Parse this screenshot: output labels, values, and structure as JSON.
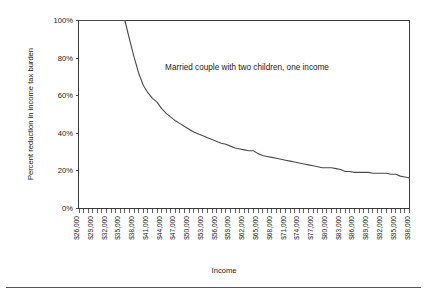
{
  "chart_data": {
    "type": "line",
    "title": "",
    "annotation": "Married couple with two children, one income",
    "xlabel": "Income",
    "ylabel": "Percent reduction in income tax burden",
    "xlim": [
      26000,
      98000
    ],
    "ylim": [
      0,
      100
    ],
    "grid": false,
    "legend_position": "none",
    "line_color": "#4a4a4a",
    "frame_color": "#3a3a3a",
    "background_color": "#ffffff",
    "ytick_labels": [
      "0%",
      "20%",
      "40%",
      "60%",
      "80%",
      "100%"
    ],
    "ytick_values": [
      0,
      20,
      40,
      60,
      80,
      100
    ],
    "xtick_labels": [
      "$26,000",
      "$29,000",
      "$32,000",
      "$35,000",
      "$38,000",
      "$41,000",
      "$44,000",
      "$47,000",
      "$50,000",
      "$53,000",
      "$56,000",
      "$59,000",
      "$62,000",
      "$65,000",
      "$68,000",
      "$71,000",
      "$74,000",
      "$77,000",
      "$80,000",
      "$83,000",
      "$86,000",
      "$89,000",
      "$92,000",
      "$95,000",
      "$98,000"
    ],
    "xtick_values": [
      26000,
      29000,
      32000,
      35000,
      38000,
      41000,
      44000,
      47000,
      50000,
      53000,
      56000,
      59000,
      62000,
      65000,
      68000,
      71000,
      74000,
      77000,
      80000,
      83000,
      86000,
      89000,
      92000,
      95000,
      98000
    ],
    "minor_tick_step": 1000,
    "x": [
      26000,
      27000,
      28000,
      29000,
      30000,
      31000,
      32000,
      33000,
      34000,
      35000,
      36000,
      37000,
      38000,
      39000,
      40000,
      41000,
      42000,
      43000,
      44000,
      45000,
      46000,
      47000,
      48000,
      49000,
      50000,
      51000,
      52000,
      53000,
      54000,
      55000,
      56000,
      57000,
      58000,
      59000,
      60000,
      61000,
      62000,
      63000,
      64000,
      65000,
      66000,
      67000,
      68000,
      69000,
      70000,
      71000,
      72000,
      73000,
      74000,
      75000,
      76000,
      77000,
      78000,
      79000,
      80000,
      81000,
      82000,
      83000,
      84000,
      85000,
      86000,
      87000,
      88000,
      89000,
      90000,
      91000,
      92000,
      93000,
      94000,
      95000,
      96000,
      97000,
      98000
    ],
    "y": [
      100,
      100,
      100,
      100,
      100,
      100,
      100,
      100,
      100,
      100,
      100,
      90,
      80.5,
      72,
      65.5,
      61.5,
      58.5,
      56.5,
      53,
      50.5,
      48.5,
      46.5,
      45,
      43.5,
      42,
      40.5,
      39.5,
      38.5,
      37.5,
      36.5,
      35.5,
      34.5,
      34,
      33,
      32,
      31.5,
      31,
      30.5,
      30.5,
      29,
      28,
      27.5,
      27,
      26.5,
      26,
      25.5,
      25,
      24.5,
      24,
      23.5,
      23,
      22.5,
      22,
      21.5,
      21.5,
      21.5,
      21,
      20.5,
      19.5,
      19.5,
      19,
      19,
      19,
      19,
      18.5,
      18.5,
      18.5,
      18.5,
      18,
      18,
      17,
      16.5,
      16
    ],
    "series": [
      {
        "name": "Married couple with two children, one income",
        "values": [
          100,
          100,
          100,
          100,
          100,
          100,
          100,
          100,
          100,
          100,
          100,
          90,
          80.5,
          72,
          65.5,
          61.5,
          58.5,
          56.5,
          53,
          50.5,
          48.5,
          46.5,
          45,
          43.5,
          42,
          40.5,
          39.5,
          38.5,
          37.5,
          36.5,
          35.5,
          34.5,
          34,
          33,
          32,
          31.5,
          31,
          30.5,
          30.5,
          29,
          28,
          27.5,
          27,
          26.5,
          26,
          25.5,
          25,
          24.5,
          24,
          23.5,
          23,
          22.5,
          22,
          21.5,
          21.5,
          21.5,
          21,
          20.5,
          19.5,
          19.5,
          19,
          19,
          19,
          19,
          18.5,
          18.5,
          18.5,
          18.5,
          18,
          18,
          17,
          16.5,
          16
        ]
      }
    ]
  }
}
